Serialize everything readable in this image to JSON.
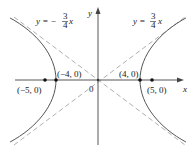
{
  "figure": {
    "type": "hyperbola",
    "equation": "x^2/16 - y^2/9 = 1",
    "axes": {
      "x_label": "x",
      "y_label": "y",
      "origin_label": "0"
    },
    "asymptotes": [
      {
        "label_lhs": "y = −",
        "num": "3",
        "den": "4",
        "rhs": "x",
        "slope": -0.75
      },
      {
        "label_lhs": "y = ",
        "num": "3",
        "den": "4",
        "rhs": "x",
        "slope": 0.75
      }
    ],
    "points": [
      {
        "label": "(−5, 0)",
        "x": -5,
        "y": 0,
        "kind": "focus"
      },
      {
        "label": "(−4, 0)",
        "x": -4,
        "y": 0,
        "kind": "vertex"
      },
      {
        "label": "(4, 0)",
        "x": 4,
        "y": 0,
        "kind": "vertex"
      },
      {
        "label": "(5, 0)",
        "x": 5,
        "y": 0,
        "kind": "focus"
      }
    ],
    "colors": {
      "curve": "#555555",
      "asymptote": "#b0b0b0",
      "axis": "#444444"
    }
  }
}
